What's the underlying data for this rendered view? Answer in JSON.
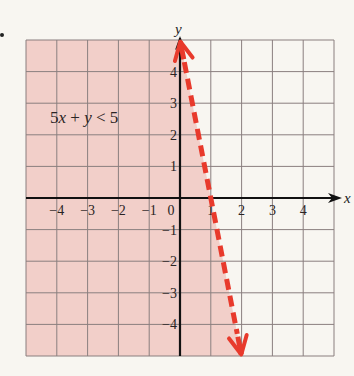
{
  "bullet": "•",
  "chart_data": {
    "type": "inequality-graph",
    "title": "",
    "inequality": "5x + y < 5",
    "label_text": {
      "a": "5x",
      "plus": "+",
      "b": "y",
      "rel": "<",
      "c": "5"
    },
    "boundary_line": {
      "equation": "5x + y = 5",
      "slope": -5,
      "y_intercept": 5,
      "x_intercept": 1,
      "style": "dashed",
      "arrows": "both",
      "points": [
        [
          0,
          5
        ],
        [
          2,
          -5
        ]
      ]
    },
    "shaded_region": "below-left of line (5x + y < 5)",
    "xlabel": "x",
    "ylabel": "y",
    "xlim": [
      -5,
      5
    ],
    "ylim": [
      -5,
      5
    ],
    "x_ticks": [
      "-4",
      "-3",
      "-2",
      "-1",
      "0",
      "1",
      "2",
      "3",
      "4"
    ],
    "x_tick_values": [
      -4,
      -3,
      -2,
      -1,
      0,
      1,
      2,
      3,
      4
    ],
    "y_ticks": [
      "4",
      "3",
      "2",
      "1",
      "-1",
      "-2",
      "-3",
      "-4"
    ],
    "y_tick_values": [
      4,
      3,
      2,
      1,
      -1,
      -2,
      -3,
      -4
    ],
    "grid": true,
    "colors": {
      "shade": "#f2cfc9",
      "line": "#e83a2c",
      "grid": "#8a7f7f",
      "axis": "#111111",
      "background": "#f8f6f1"
    }
  }
}
